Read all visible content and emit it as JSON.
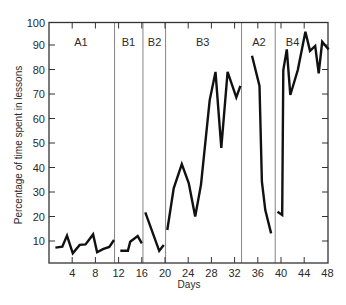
{
  "chart_data": {
    "type": "line",
    "title": "",
    "xlabel": "Days",
    "ylabel": "Percentage of time spent in lessons",
    "xlim": [
      0,
      48
    ],
    "ylim": [
      0,
      100
    ],
    "x_ticks": [
      4,
      8,
      12,
      16,
      20,
      24,
      28,
      32,
      36,
      40,
      44,
      48
    ],
    "y_ticks": [
      10,
      20,
      30,
      40,
      50,
      60,
      70,
      80,
      90,
      100
    ],
    "grid": false,
    "legend": null,
    "phase_boundaries": [
      11.3,
      16.2,
      20.1,
      33.2,
      39.0
    ],
    "phases": [
      {
        "label": "A1",
        "label_x": 5.5
      },
      {
        "label": "B1",
        "label_x": 13.7
      },
      {
        "label": "B2",
        "label_x": 18.2
      },
      {
        "label": "B3",
        "label_x": 26.5
      },
      {
        "label": "A2",
        "label_x": 36.2
      },
      {
        "label": "B4",
        "label_x": 42.0
      }
    ],
    "series": [
      {
        "name": "A1",
        "x": [
          1.1,
          2.3,
          3.1,
          4.1,
          5.3,
          6.3,
          7.6,
          8.3,
          9.3,
          10.4,
          11.2
        ],
        "values": [
          7.3,
          7.7,
          12.2,
          5.0,
          8.4,
          8.6,
          12.7,
          5.4,
          6.7,
          7.6,
          10.4
        ]
      },
      {
        "name": "B1",
        "x": [
          12.3,
          13.6,
          14.0,
          15.3,
          16.0
        ],
        "values": [
          6.0,
          6.0,
          9.7,
          12.0,
          9.0
        ]
      },
      {
        "name": "B2",
        "x": [
          16.6,
          19.0,
          19.8
        ],
        "values": [
          21.7,
          6.0,
          8.4
        ]
      },
      {
        "name": "B3",
        "x": [
          20.4,
          21.5,
          22.9,
          24.1,
          25.2,
          26.2,
          27.7,
          28.7,
          29.7,
          30.8,
          32.3,
          33.0
        ],
        "values": [
          14.5,
          31.5,
          41.4,
          33.5,
          20.0,
          33.0,
          67.5,
          79.0,
          48.0,
          79.0,
          68.6,
          73.3
        ]
      },
      {
        "name": "A2",
        "x": [
          35.0,
          36.3,
          36.7,
          37.3,
          38.3
        ],
        "values": [
          85.6,
          73.3,
          34.2,
          22.6,
          13.1
        ]
      },
      {
        "name": "B4",
        "x": [
          39.4,
          40.2,
          40.4,
          41.0,
          41.6,
          42.9,
          44.2,
          45.0,
          45.9,
          46.5,
          47.1,
          47.7,
          48.2
        ],
        "values": [
          21.9,
          20.6,
          79.8,
          88.2,
          69.6,
          79.8,
          95.4,
          87.6,
          89.6,
          78.4,
          91.3,
          89.6,
          88.2
        ]
      }
    ],
    "colors": {
      "line": "#111111",
      "axis": "#333333",
      "phase_line": "#777777",
      "text": "#2a2a2a"
    }
  }
}
